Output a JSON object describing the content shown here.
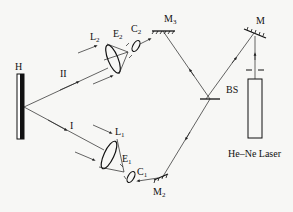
{
  "diagram": {
    "type": "optical holography setup",
    "labels": {
      "hologram": "H",
      "beam_one": "I",
      "beam_two": "II",
      "lens_one": "L",
      "lens_one_sub": "1",
      "lens_two": "L",
      "lens_two_sub": "2",
      "pinhole_one": "E",
      "pinhole_one_sub": "1",
      "pinhole_two": "E",
      "pinhole_two_sub": "2",
      "collimator_one": "C",
      "collimator_one_sub": "1",
      "collimator_two": "C",
      "collimator_two_sub": "2",
      "mirror_two": "M",
      "mirror_two_sub": "2",
      "mirror_three": "M",
      "mirror_three_sub": "3",
      "mirror_main": "M",
      "beam_splitter": "BS",
      "laser": "He–Ne Laser"
    },
    "colors": {
      "line": "#222222",
      "background": "#f7f7f5"
    }
  }
}
